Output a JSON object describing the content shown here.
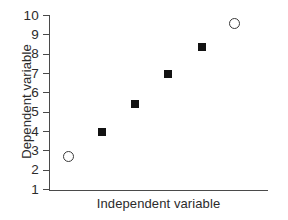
{
  "chart_data": {
    "type": "scatter",
    "title": "",
    "xlabel": "Independent variable",
    "ylabel": "Dependent variable",
    "ylim": [
      1,
      10
    ],
    "yticks": [
      10,
      9,
      8,
      7,
      6,
      5,
      4,
      3,
      2,
      1
    ],
    "ytick_labels": [
      "10",
      "9",
      "8",
      "7",
      "6",
      "5",
      "4",
      "3",
      "2",
      "1"
    ],
    "xticks": [],
    "xtick_labels": [],
    "grid": false,
    "legend": null,
    "series": [
      {
        "name": "data",
        "points": [
          {
            "x": 1,
            "y": 2.7,
            "marker": "open-circle",
            "color": "#3a3a3a"
          },
          {
            "x": 2,
            "y": 4.0,
            "marker": "filled-square",
            "color": "#121212"
          },
          {
            "x": 3,
            "y": 5.45,
            "marker": "filled-square",
            "color": "#121212"
          },
          {
            "x": 4,
            "y": 7.0,
            "marker": "filled-square",
            "color": "#121212"
          },
          {
            "x": 5,
            "y": 8.35,
            "marker": "filled-square",
            "color": "#121212"
          },
          {
            "x": 6,
            "y": 9.6,
            "marker": "open-circle",
            "color": "#3a3a3a"
          }
        ]
      }
    ],
    "xlim": [
      0.4,
      7.0
    ],
    "axis_color": "#4a4a4a",
    "background": "#ffffff"
  }
}
